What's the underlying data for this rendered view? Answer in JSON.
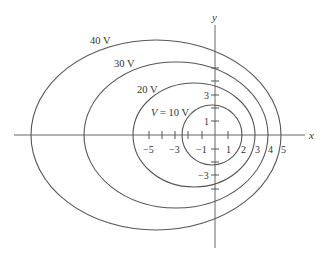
{
  "diagram": {
    "type": "equipotential-contours",
    "axes": {
      "x_label": "x",
      "y_label": "y",
      "x_tick_labels": [
        "−5",
        "−3",
        "−1",
        "1",
        "2",
        "3",
        "4",
        "5"
      ],
      "y_tick_labels": [
        "3",
        "1",
        "−1",
        "−3"
      ]
    },
    "contours": [
      {
        "label": "V = 10 V",
        "label_prefix": "V",
        "label_rest": " = 10 V",
        "value": 10
      },
      {
        "label": "20 V",
        "value": 20
      },
      {
        "label": "30 V",
        "value": 30
      },
      {
        "label": "40 V",
        "value": 40
      }
    ]
  }
}
